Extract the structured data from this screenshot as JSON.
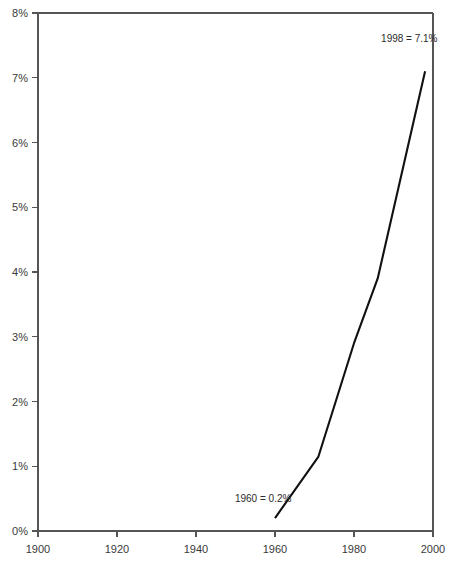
{
  "chart_data": {
    "type": "line",
    "title": "",
    "xlabel": "",
    "ylabel": "",
    "xlim": [
      1900,
      2000
    ],
    "ylim": [
      0,
      8
    ],
    "grid": false,
    "legend": false,
    "legend_position": "none",
    "x_tick_labels": [
      "1900",
      "1920",
      "1940",
      "1960",
      "1980",
      "2000"
    ],
    "x_ticks": [
      1900,
      1920,
      1940,
      1960,
      1980,
      2000
    ],
    "y_tick_labels": [
      "0%",
      "1%",
      "2%",
      "3%",
      "4%",
      "5%",
      "6%",
      "7%",
      "8%"
    ],
    "y_ticks": [
      0,
      1,
      2,
      3,
      4,
      5,
      6,
      7,
      8
    ],
    "series": [
      {
        "name": "value",
        "x": [
          1960,
          1971,
          1980,
          1986,
          1995,
          1998
        ],
        "values": [
          0.2,
          1.15,
          2.9,
          3.9,
          6.3,
          7.1
        ]
      }
    ],
    "annotations": [
      {
        "name": "end-point-label",
        "text": "1998 = 7.1%",
        "x": 1994,
        "y": 7.55
      },
      {
        "name": "start-point-label",
        "text": "1960 = 0.2%",
        "x": 1957,
        "y": 0.45
      }
    ],
    "colors": {
      "line": "#111111",
      "axis": "#555555",
      "text": "#3a3a3a",
      "background": "#ffffff"
    }
  }
}
